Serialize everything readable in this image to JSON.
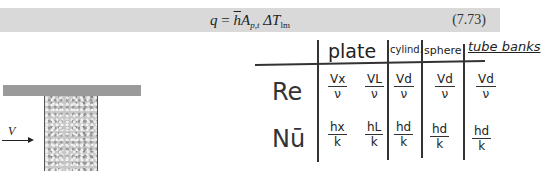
{
  "equation": {
    "lhs": "q",
    "equals": "=",
    "h": "h",
    "A": "A",
    "A_sub": "p,t",
    "delta": "ΔT",
    "delta_sub": "lm",
    "number": "(7.73)"
  },
  "diagram": {
    "velocity_label": "V"
  },
  "table": {
    "columns": [
      "plate",
      "cylind.",
      "sphere",
      "tube banks"
    ],
    "rows": [
      {
        "label": "Re",
        "cells": [
          {
            "num": "Vx",
            "den": "ν"
          },
          {
            "num": "VL",
            "den": "ν"
          },
          {
            "num": "Vd",
            "den": "ν"
          },
          {
            "num": "Vd",
            "den": "ν"
          },
          {
            "num": "Vd",
            "den": "ν"
          }
        ]
      },
      {
        "label": "Nū",
        "cells": [
          {
            "num": "hx",
            "den": "k"
          },
          {
            "num": "hL",
            "den": "k"
          },
          {
            "num": "hd",
            "den": "k"
          },
          {
            "num": "hd",
            "den": "k"
          },
          {
            "num": "hd",
            "den": "k"
          }
        ]
      }
    ]
  }
}
